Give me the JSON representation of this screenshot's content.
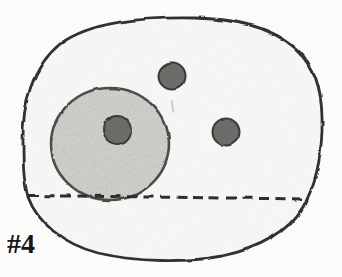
{
  "figure": {
    "label": "#4",
    "type": "cell-diagram",
    "parts": [
      "cell-membrane",
      "cytoplasm",
      "nucleus",
      "nucleolus",
      "organelle-top",
      "organelle-right",
      "dashed-line"
    ]
  },
  "colors": {
    "page_background": "#fdfdfc",
    "cell_fill": "#f8f7f5",
    "cell_outline": "#2e2d2b",
    "nucleus_fill": "#d9d7d4",
    "nucleus_outline": "#4a4847",
    "organelle_fill": "#6b6a68",
    "organelle_outline": "#383736",
    "dashed_line": "#2b2a28",
    "faint_mark": "#c6c4c1",
    "label_color": "#121212"
  }
}
